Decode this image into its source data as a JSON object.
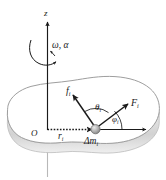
{
  "figure": {
    "background_color": "#ffffff",
    "stroke_color": "#1a1a1a",
    "body_fill_color": "#ffffff",
    "body_edge_color": "#c9c9c9",
    "body_shadow_color": "#d8d8d8",
    "particle_color": "#9a9a9a"
  },
  "labels": {
    "axis_z": "z",
    "rotation": "ω, α",
    "force_internal": "f",
    "force_internal_sub": "i",
    "force_external": "F",
    "force_external_sub": "i",
    "angle_theta": "θ",
    "angle_theta_sub": "i",
    "angle_phi": "φ",
    "angle_phi_sub": "i",
    "origin": "O",
    "radius": "r",
    "radius_sub": "i",
    "mass_element": "Δm",
    "mass_element_sub": "i"
  }
}
